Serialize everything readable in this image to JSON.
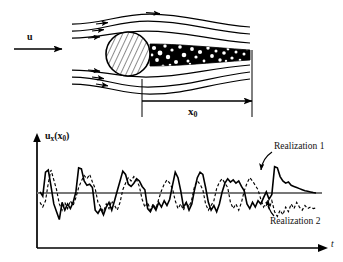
{
  "figure": {
    "background_color": "#ffffff",
    "line_color": "#000000"
  },
  "flow_diagram": {
    "name": "cylinder-wake-flow-diagram",
    "inlet_velocity_label": "u",
    "inlet_arrow": "right-arrow",
    "cylinder": {
      "name": "cylinder-cross-section",
      "fill": "diagonal-hatch",
      "center_x": 128,
      "center_y": 54,
      "radius": 22
    },
    "wake": {
      "name": "turbulent-wake-region",
      "texture": "speckled-turbulent",
      "color": "#000000"
    },
    "streamlines": {
      "name": "streamlines",
      "count": 6,
      "arrow_glyph": "solid-triangle"
    },
    "dimension": {
      "name": "x0-dimension-line",
      "label": "x",
      "label_subscript": "0",
      "start_x": 142,
      "end_x": 252,
      "y": 105,
      "arrow_at": "right"
    },
    "reference_line": {
      "name": "downstream-reference-line",
      "x": 252
    }
  },
  "time_series_plot": {
    "name": "velocity-time-series-plot",
    "yaxis": {
      "name": "y-axis",
      "label": "u",
      "label_subscript": "x",
      "label_argument": "(x",
      "label_argument_subscript": "0",
      "label_argument_close": ")",
      "label_full": "u_x(x_0)",
      "arrow": "up"
    },
    "xaxis": {
      "name": "x-axis",
      "label": "t",
      "arrow": "right"
    },
    "mean_line": {
      "name": "mean-value-line",
      "style": "solid-thick-gray",
      "color": "#777777"
    },
    "series": [
      {
        "name": "realization-1",
        "label": "Realization 1",
        "style": "solid",
        "color": "#000000",
        "annotation_arrow": "curved-pointer"
      },
      {
        "name": "realization-2",
        "label": "Realization 2",
        "style": "dashed",
        "color": "#000000",
        "annotation_arrow": "curved-pointer"
      }
    ]
  },
  "chart_data": {
    "type": "line",
    "title": "",
    "xlabel": "t",
    "ylabel": "u_x(x_0)",
    "grid": false,
    "legend": "annotated-callouts",
    "xlim": [
      0,
      100
    ],
    "ylim": [
      -1.25,
      1.6
    ],
    "mean": 0,
    "series": [
      {
        "name": "Realization 1",
        "style": "solid",
        "values": [
          0.05,
          -0.1,
          0.95,
          1.05,
          0.3,
          -0.35,
          -0.6,
          -0.85,
          -0.3,
          -0.55,
          -0.35,
          -0.5,
          -0.3,
          0.05,
          1.15,
          1.1,
          0.55,
          0.35,
          0.4,
          0.25,
          -0.55,
          -0.65,
          -0.5,
          -0.7,
          -0.45,
          -0.3,
          -0.55,
          -0.25,
          0.1,
          0.55,
          1.0,
          0.85,
          0.4,
          0.3,
          0.45,
          0.65,
          0.55,
          0.3,
          0.15,
          -0.5,
          -0.6,
          -0.4,
          -0.55,
          -0.3,
          -0.45,
          -0.25,
          -0.4,
          -0.2,
          0.35,
          0.95,
          0.7,
          0.1,
          -0.45,
          -0.3,
          -0.55,
          -0.35,
          0.15,
          0.7,
          0.95,
          0.85,
          0.25,
          -0.3,
          -0.55,
          -0.4,
          -0.6,
          -0.35,
          0.05,
          0.45,
          0.65,
          0.5,
          0.6,
          0.45,
          0.55,
          0.3,
          0.1,
          -0.35,
          -0.5,
          -0.3,
          -0.45,
          -0.25,
          -0.35,
          -0.15,
          0.05,
          -0.2,
          -0.05,
          1.2,
          1.15,
          0.75,
          0.55,
          0.45,
          0.5,
          0.35,
          0.3,
          0.25,
          0.2,
          0.15,
          0.1,
          0.08,
          0.05,
          0.02,
          0.0
        ]
      },
      {
        "name": "Realization 2",
        "style": "dashed",
        "values": [
          -0.3,
          -0.45,
          -0.25,
          0.45,
          1.05,
          0.6,
          0.15,
          -0.35,
          -0.55,
          -0.3,
          -0.5,
          -0.25,
          -0.4,
          -0.15,
          0.25,
          0.55,
          0.8,
          0.65,
          0.85,
          0.5,
          0.2,
          -0.3,
          -0.45,
          -0.6,
          -0.35,
          -0.5,
          -0.25,
          -0.4,
          -0.55,
          -0.3,
          0.15,
          0.45,
          0.7,
          0.55,
          0.75,
          0.6,
          0.3,
          -0.2,
          -0.45,
          -0.3,
          -0.55,
          -0.35,
          -0.5,
          -0.2,
          0.1,
          0.4,
          0.6,
          0.45,
          0.2,
          -0.25,
          -0.5,
          -0.35,
          -0.55,
          -0.3,
          -0.45,
          -0.2,
          0.3,
          0.55,
          0.4,
          0.15,
          -0.35,
          -0.55,
          -0.4,
          -0.25,
          0.2,
          0.5,
          0.65,
          0.45,
          0.25,
          -0.3,
          -0.5,
          -0.35,
          -0.55,
          -0.3,
          0.1,
          0.45,
          0.7,
          0.55,
          0.35,
          0.15,
          -0.2,
          -0.45,
          -0.3,
          -0.5,
          -0.25,
          -0.6,
          -0.75,
          -0.55,
          -0.7,
          -0.45,
          -0.6,
          -0.35,
          -0.5,
          -0.3,
          -0.45,
          -0.55,
          -0.4,
          -0.5,
          -0.45,
          -0.5,
          -0.48
        ]
      }
    ]
  }
}
